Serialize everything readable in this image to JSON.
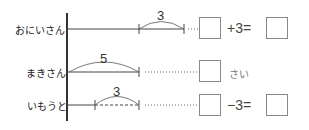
{
  "rows": [
    {
      "label": "おにいさん",
      "arc_value": "3",
      "op1": "+3=",
      "has_result_box": true
    },
    {
      "label": "まきさん",
      "arc_value": "5",
      "unit": "さい"
    },
    {
      "label": "いもうと",
      "arc_value": "3",
      "op1": "−3=",
      "has_result_box": true
    }
  ],
  "colors": {
    "line": "#333333",
    "box": "#888888",
    "text": "#222222"
  }
}
